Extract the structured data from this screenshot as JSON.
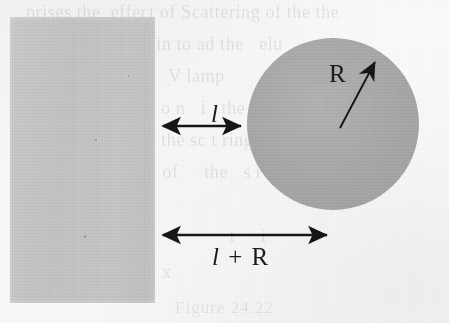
{
  "figure": {
    "kind": "geometry-diagram",
    "background_color": "#fdfdfd",
    "ink_color": "#1a1a1a"
  },
  "slab": {
    "label": "half-space-slab",
    "fill": "#c8c8c6",
    "x": 10,
    "y": 17,
    "width": 145,
    "height": 286
  },
  "sphere": {
    "label": "shaded-sphere",
    "fill": "#ababa9",
    "center_x": 333,
    "center_y": 124,
    "radius": 86
  },
  "labels": {
    "gap": "l",
    "total_italic": "l",
    "total_operator": "+",
    "total_upright": "R",
    "radius": "R"
  },
  "arrows": {
    "gap": {
      "name": "gap-dimension-arrow",
      "x1": 155,
      "y1": 126,
      "x2": 249,
      "y2": 126,
      "heads": "both"
    },
    "total": {
      "name": "total-dimension-arrow",
      "x1": 155,
      "y1": 235,
      "x2": 335,
      "y2": 235,
      "heads": "both"
    },
    "radius": {
      "name": "radius-arrow",
      "x1": 340,
      "y1": 128,
      "x2": 379,
      "y2": 56,
      "heads": "end"
    }
  },
  "bleed_through": [
    {
      "text": "prises the  effect of   Scattering  of  the  the",
      "x": 26,
      "y": 2,
      "size": 18
    },
    {
      "text": "cle   ize   is  to  begin  to  ad  the    elu",
      "x": 34,
      "y": 34,
      "size": 18
    },
    {
      "text": "h     y        al   er the     V  lamp",
      "x": 40,
      "y": 66,
      "size": 18
    },
    {
      "text": "tr       i    e    t    c    o  n    i    the",
      "x": 44,
      "y": 98,
      "size": 18
    },
    {
      "text": "ma      of      ion  of  the  sc  t  ring    m",
      "x": 40,
      "y": 130,
      "size": 18
    },
    {
      "text": "vir         ml    ed     of      the    s   r",
      "x": 36,
      "y": 162,
      "size": 18
    },
    {
      "text": "particles.",
      "x": 42,
      "y": 194,
      "size": 18
    },
    {
      "text": "This              e                t      i",
      "x": 44,
      "y": 226,
      "size": 18
    },
    {
      "text": "ds         d  +        x",
      "x": 48,
      "y": 262,
      "size": 18
    }
  ],
  "caption_ghost": "Figure 24.22"
}
